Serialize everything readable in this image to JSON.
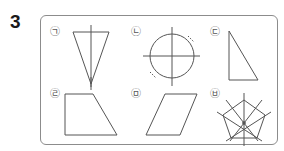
{
  "question": {
    "number": "3"
  },
  "figures": [
    {
      "label": "㉠",
      "shape": "isosceles-triangle-with-symmetry-axis"
    },
    {
      "label": "㉡",
      "shape": "circle-with-axes"
    },
    {
      "label": "㉢",
      "shape": "right-triangle"
    },
    {
      "label": "㉣",
      "shape": "trapezoid"
    },
    {
      "label": "㉤",
      "shape": "parallelogram"
    },
    {
      "label": "㉥",
      "shape": "regular-pentagon-with-symmetry-axes"
    }
  ],
  "colors": {
    "line": "#555555",
    "frame": "#8c8c8c"
  }
}
